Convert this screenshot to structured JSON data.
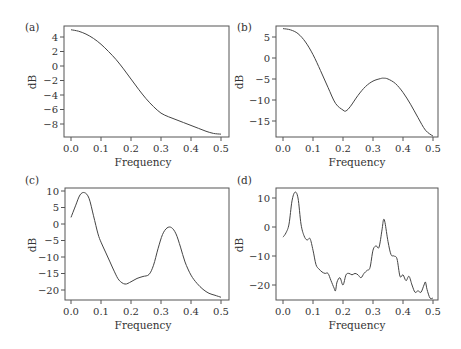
{
  "chart_data": [
    {
      "id": "a",
      "panel_label": "(a)",
      "type": "line",
      "title": "",
      "xlabel": "Frequency",
      "ylabel": "dB",
      "xlim": [
        0.0,
        0.5
      ],
      "ylim": [
        -9.5,
        5.5
      ],
      "xticks": [
        0.0,
        0.1,
        0.2,
        0.3,
        0.4,
        0.5
      ],
      "xtick_labels": [
        "0.0",
        "0.1",
        "0.2",
        "0.3",
        "0.4",
        "0.5"
      ],
      "yticks": [
        4,
        2,
        0,
        -2,
        -4,
        -6,
        -8
      ],
      "ytick_labels": [
        "4",
        "2",
        "0",
        "−2",
        "−4",
        "−6",
        "−8"
      ],
      "grid": false,
      "legend": null,
      "x": [
        0.0,
        0.025,
        0.05,
        0.075,
        0.1,
        0.125,
        0.15,
        0.175,
        0.2,
        0.225,
        0.25,
        0.275,
        0.3,
        0.325,
        0.35,
        0.375,
        0.4,
        0.425,
        0.45,
        0.475,
        0.5
      ],
      "y": [
        5.0,
        4.8,
        4.4,
        3.8,
        3.0,
        2.0,
        0.9,
        -0.4,
        -1.8,
        -3.2,
        -4.5,
        -5.6,
        -6.5,
        -7.0,
        -7.4,
        -7.8,
        -8.2,
        -8.6,
        -9.0,
        -9.3,
        -9.4
      ]
    },
    {
      "id": "b",
      "panel_label": "(b)",
      "type": "line",
      "title": "",
      "xlabel": "Frequency",
      "ylabel": "dB",
      "xlim": [
        0.0,
        0.5
      ],
      "ylim": [
        -19.5,
        8.0
      ],
      "xticks": [
        0.0,
        0.1,
        0.2,
        0.3,
        0.4,
        0.5
      ],
      "xtick_labels": [
        "0.0",
        "0.1",
        "0.2",
        "0.3",
        "0.4",
        "0.5"
      ],
      "yticks": [
        5,
        0,
        -5,
        -10,
        -15
      ],
      "ytick_labels": [
        "5",
        "0",
        "−5",
        "−10",
        "−15"
      ],
      "grid": false,
      "legend": null,
      "x": [
        0.0,
        0.025,
        0.05,
        0.075,
        0.1,
        0.125,
        0.15,
        0.175,
        0.2,
        0.21,
        0.225,
        0.25,
        0.275,
        0.3,
        0.325,
        0.335,
        0.35,
        0.375,
        0.4,
        0.425,
        0.45,
        0.475,
        0.5
      ],
      "y": [
        7.0,
        6.7,
        5.8,
        3.8,
        0.8,
        -3.0,
        -7.0,
        -10.8,
        -12.4,
        -12.6,
        -11.5,
        -8.9,
        -6.8,
        -5.5,
        -4.9,
        -4.8,
        -5.0,
        -6.1,
        -8.2,
        -11.0,
        -14.2,
        -17.2,
        -18.6
      ]
    },
    {
      "id": "c",
      "panel_label": "(c)",
      "type": "line",
      "title": "",
      "xlabel": "Frequency",
      "ylabel": "dB",
      "xlim": [
        0.0,
        0.5
      ],
      "ylim": [
        -23.0,
        10.5
      ],
      "xticks": [
        0.0,
        0.1,
        0.2,
        0.3,
        0.4,
        0.5
      ],
      "xtick_labels": [
        "0.0",
        "0.1",
        "0.2",
        "0.3",
        "0.4",
        "0.5"
      ],
      "yticks": [
        10,
        5,
        0,
        -5,
        -10,
        -15,
        -20
      ],
      "ytick_labels": [
        "10",
        "5",
        "0",
        "−5",
        "−10",
        "−15",
        "−20"
      ],
      "grid": false,
      "legend": null,
      "x": [
        0.0,
        0.015,
        0.03,
        0.045,
        0.06,
        0.075,
        0.09,
        0.1,
        0.115,
        0.13,
        0.145,
        0.16,
        0.18,
        0.2,
        0.22,
        0.24,
        0.26,
        0.275,
        0.29,
        0.305,
        0.32,
        0.335,
        0.35,
        0.365,
        0.38,
        0.4,
        0.42,
        0.44,
        0.46,
        0.48,
        0.5
      ],
      "y": [
        2.0,
        5.5,
        8.8,
        9.5,
        7.8,
        2.5,
        -3.0,
        -5.5,
        -8.5,
        -11.5,
        -14.5,
        -17.0,
        -18.2,
        -17.5,
        -16.5,
        -15.9,
        -15.3,
        -12.5,
        -7.5,
        -3.2,
        -1.2,
        -1.1,
        -3.0,
        -7.0,
        -11.5,
        -15.5,
        -18.0,
        -19.8,
        -21.0,
        -21.6,
        -22.2
      ]
    },
    {
      "id": "d",
      "panel_label": "(d)",
      "type": "line",
      "title": "",
      "xlabel": "Frequency",
      "ylabel": "dB",
      "xlim": [
        0.0,
        0.5
      ],
      "ylim": [
        -26.0,
        14.0
      ],
      "xticks": [
        0.0,
        0.1,
        0.2,
        0.3,
        0.4,
        0.5
      ],
      "xtick_labels": [
        "0.0",
        "0.1",
        "0.2",
        "0.3",
        "0.4",
        "0.5"
      ],
      "yticks": [
        10,
        0,
        -10,
        -20
      ],
      "ytick_labels": [
        "10",
        "0",
        "−10",
        "−20"
      ],
      "grid": false,
      "legend": null,
      "x": [
        0.0,
        0.01,
        0.02,
        0.03,
        0.04,
        0.05,
        0.06,
        0.07,
        0.08,
        0.09,
        0.1,
        0.11,
        0.12,
        0.13,
        0.14,
        0.15,
        0.16,
        0.17,
        0.175,
        0.18,
        0.19,
        0.2,
        0.21,
        0.22,
        0.23,
        0.24,
        0.25,
        0.26,
        0.27,
        0.28,
        0.29,
        0.3,
        0.31,
        0.32,
        0.33,
        0.335,
        0.34,
        0.35,
        0.36,
        0.37,
        0.38,
        0.39,
        0.4,
        0.41,
        0.42,
        0.43,
        0.44,
        0.45,
        0.46,
        0.47,
        0.475,
        0.48,
        0.49,
        0.5
      ],
      "y": [
        -3.5,
        -2.0,
        1.0,
        9.0,
        12.0,
        10.0,
        1.0,
        -3.0,
        -4.5,
        -4.0,
        -8.0,
        -13.0,
        -14.5,
        -15.5,
        -16.0,
        -16.0,
        -18.5,
        -21.0,
        -22.0,
        -19.0,
        -17.5,
        -20.0,
        -16.5,
        -16.0,
        -16.5,
        -16.0,
        -16.5,
        -17.5,
        -16.0,
        -15.0,
        -14.0,
        -8.0,
        -6.5,
        -7.0,
        -1.0,
        2.5,
        1.5,
        -5.0,
        -9.5,
        -10.0,
        -11.0,
        -17.0,
        -16.5,
        -18.5,
        -17.0,
        -20.0,
        -22.5,
        -22.0,
        -22.5,
        -20.0,
        -19.0,
        -21.5,
        -24.5,
        -24.5
      ]
    }
  ]
}
